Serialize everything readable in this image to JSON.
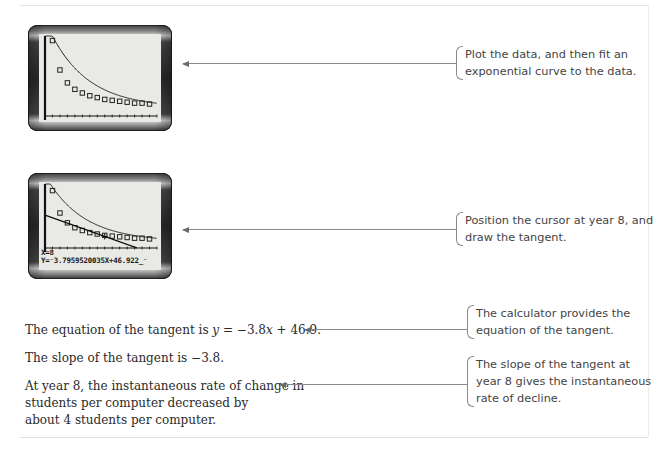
{
  "steps": [
    {
      "calculator": {
        "screen": "scatter-with-exponential-fit",
        "points_x": [
          1,
          2,
          3,
          4,
          5,
          6,
          7,
          8,
          9,
          10,
          11,
          12,
          13,
          14
        ],
        "points_y": [
          82,
          50,
          36,
          29,
          25,
          22,
          20,
          18,
          17,
          16,
          15,
          14,
          14,
          13
        ]
      },
      "note": "Plot the data, and then fit an exponential curve to the data."
    },
    {
      "calculator": {
        "screen": "tangent-at-year-8",
        "readout_x": "X=8",
        "readout_y": "Y=⁻3.7959520035X+46.922_⁻"
      },
      "note": "Position the cursor at year 8, and draw the tangent."
    }
  ],
  "statements": [
    {
      "prefix": "The equation of the tangent is ",
      "var": "y",
      "suffix_a": " = −3.8",
      "var2": "x",
      "suffix_b": " + 46.9.",
      "note": "The calculator provides the equation of the tangent."
    },
    {
      "text": "The slope of the tangent is −3.8."
    },
    {
      "lines": [
        "At year 8, the instantaneous rate of change in",
        "students per computer decreased by",
        "about 4 students per computer."
      ],
      "note": "The slope of the tangent at year 8 gives the instantaneous rate of decline."
    }
  ],
  "icons": {
    "arrow": "left-arrow-icon",
    "bracket": "left-brace-icon"
  }
}
